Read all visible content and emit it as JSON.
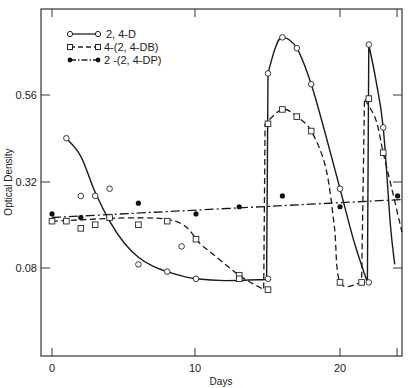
{
  "chart_data": {
    "type": "line",
    "title": "",
    "xlabel": "Days",
    "ylabel": "Optical Density",
    "xlim": [
      -0.8,
      24.5
    ],
    "ylim": [
      0.0,
      0.83
    ],
    "xticks": [
      0,
      10,
      20
    ],
    "xtick_labels": [
      "0",
      "10",
      "20"
    ],
    "yticks": [
      0.08,
      0.32,
      0.56
    ],
    "ytick_labels": [
      "0.08",
      "0.32",
      "0.56"
    ],
    "grid": false,
    "legend_position": "upper left",
    "series": [
      {
        "name": "2, 4-D",
        "marker": "open-circle",
        "line": "solid",
        "points": [
          [
            1,
            0.44
          ],
          [
            2,
            0.28
          ],
          [
            3,
            0.28
          ],
          [
            4,
            0.3
          ],
          [
            6,
            0.09
          ],
          [
            8,
            0.07
          ],
          [
            9,
            0.14
          ],
          [
            10,
            0.05
          ],
          [
            15,
            0.05
          ],
          [
            15,
            0.62
          ],
          [
            16,
            0.72
          ],
          [
            17,
            0.69
          ],
          [
            18,
            0.59
          ],
          [
            20,
            0.3
          ],
          [
            22,
            0.04
          ],
          [
            22,
            0.7
          ],
          [
            23,
            0.47
          ]
        ],
        "curve": [
          [
            1,
            0.44
          ],
          [
            2,
            0.39
          ],
          [
            3,
            0.29
          ],
          [
            4,
            0.21
          ],
          [
            5,
            0.15
          ],
          [
            6,
            0.11
          ],
          [
            7,
            0.085
          ],
          [
            8,
            0.07
          ],
          [
            9,
            0.058
          ],
          [
            10,
            0.05
          ],
          [
            12,
            0.045
          ],
          [
            14.9,
            0.048
          ],
          [
            15,
            0.62
          ],
          [
            15.5,
            0.69
          ],
          [
            16,
            0.72
          ],
          [
            17,
            0.69
          ],
          [
            18,
            0.59
          ],
          [
            19,
            0.45
          ],
          [
            20,
            0.3
          ],
          [
            21,
            0.15
          ],
          [
            21.9,
            0.04
          ],
          [
            22,
            0.7
          ],
          [
            22.5,
            0.6
          ],
          [
            23,
            0.47
          ],
          [
            23.5,
            0.2
          ],
          [
            23.8,
            0.09
          ]
        ]
      },
      {
        "name": "4-(2, 4-DB)",
        "marker": "open-square",
        "line": "dashed",
        "points": [
          [
            0,
            0.21
          ],
          [
            1,
            0.21
          ],
          [
            2,
            0.19
          ],
          [
            3,
            0.2
          ],
          [
            4,
            0.22
          ],
          [
            6,
            0.2
          ],
          [
            8,
            0.21
          ],
          [
            10,
            0.16
          ],
          [
            13,
            0.06
          ],
          [
            13,
            0.05
          ],
          [
            15,
            0.02
          ],
          [
            15,
            0.48
          ],
          [
            16,
            0.52
          ],
          [
            17,
            0.5
          ],
          [
            18,
            0.46
          ],
          [
            20,
            0.04
          ],
          [
            21.5,
            0.04
          ],
          [
            22,
            0.55
          ],
          [
            23,
            0.4
          ]
        ],
        "curve": [
          [
            0,
            0.21
          ],
          [
            8,
            0.215
          ],
          [
            10.5,
            0.14
          ],
          [
            13,
            0.06
          ],
          [
            14.7,
            0.02
          ],
          [
            14.8,
            0.48
          ],
          [
            16,
            0.52
          ],
          [
            17,
            0.5
          ],
          [
            18,
            0.46
          ],
          [
            19,
            0.36
          ],
          [
            19.6,
            0.2
          ],
          [
            20,
            0.04
          ],
          [
            21.5,
            0.04
          ],
          [
            21.7,
            0.55
          ],
          [
            22.5,
            0.49
          ],
          [
            23,
            0.4
          ],
          [
            23.6,
            0.3
          ],
          [
            24.3,
            0.18
          ]
        ]
      },
      {
        "name": "2 -(2, 4-DP)",
        "marker": "filled-circle",
        "line": "dash-dot",
        "points": [
          [
            0,
            0.23
          ],
          [
            2,
            0.22
          ],
          [
            6,
            0.26
          ],
          [
            10,
            0.23
          ],
          [
            13,
            0.25
          ],
          [
            16,
            0.28
          ],
          [
            20,
            0.25
          ],
          [
            24,
            0.28
          ]
        ],
        "curve": [
          [
            0,
            0.22
          ],
          [
            24.3,
            0.27
          ]
        ]
      }
    ]
  },
  "axes": {
    "xlabel": "Days",
    "ylabel": "Optical Density",
    "xticks": [
      "0",
      "10",
      "20"
    ],
    "yticks": [
      "0.08",
      "0.32",
      "0.56"
    ]
  },
  "legend": [
    {
      "label": "2, 4-D"
    },
    {
      "label": "4-(2, 4-DB)"
    },
    {
      "label": "2 -(2, 4-DP)"
    }
  ]
}
